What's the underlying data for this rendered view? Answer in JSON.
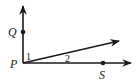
{
  "diagram": {
    "type": "geometry-angles",
    "vertex": {
      "label": "P",
      "x": 23,
      "y": 63
    },
    "rays": [
      {
        "name": "ray-PQ",
        "through": "Q",
        "end": [
          23,
          5
        ]
      },
      {
        "name": "ray-middle",
        "through": null,
        "end": [
          120,
          41
        ]
      },
      {
        "name": "ray-PS",
        "through": "S",
        "end": [
          132,
          63
        ]
      }
    ],
    "points": [
      {
        "label": "Q",
        "x": 23,
        "y": 32
      },
      {
        "label": "S",
        "x": 103,
        "y": 63
      }
    ],
    "angles": [
      {
        "label": "1",
        "between": [
          "ray-PQ",
          "ray-middle"
        ]
      },
      {
        "label": "2",
        "between": [
          "ray-middle",
          "ray-PS"
        ]
      }
    ],
    "colors": {
      "stroke": "#1a1a1a",
      "background": "#ffffff"
    }
  },
  "labels": {
    "Q": "Q",
    "P": "P",
    "S": "S",
    "angle1": "1",
    "angle2": "2"
  }
}
